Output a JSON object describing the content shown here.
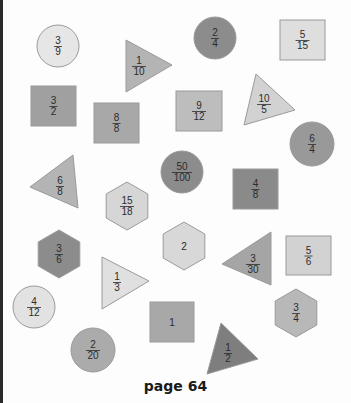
{
  "page": {
    "footer_label": "page 64",
    "colors": {
      "background": "#fdfdfd",
      "stroke": "#9a9a9a",
      "text": "#2b2b2b"
    }
  },
  "shapes": [
    {
      "id": "s1",
      "type": "circle",
      "label_num": "3",
      "label_den": "9",
      "cx": 58,
      "cy": 46,
      "r": 21,
      "fill": "#e6e6e6"
    },
    {
      "id": "s2",
      "type": "triangle",
      "label_num": "1",
      "label_den": "10",
      "points": [
        [
          126,
          40
        ],
        [
          172,
          65
        ],
        [
          126,
          92
        ]
      ],
      "tx": 139,
      "ty": 66,
      "fill": "#b4b4b4"
    },
    {
      "id": "s3",
      "type": "circle",
      "label_num": "2",
      "label_den": "4",
      "cx": 215,
      "cy": 38,
      "r": 21,
      "fill": "#8c8c8c"
    },
    {
      "id": "s4",
      "type": "square",
      "label_num": "5",
      "label_den": "15",
      "x": 280,
      "y": 20,
      "w": 45,
      "h": 40,
      "fill": "#dedede"
    },
    {
      "id": "s5",
      "type": "square",
      "label_num": "3",
      "label_den": "2",
      "x": 31,
      "y": 86,
      "w": 45,
      "h": 40,
      "fill": "#a0a0a0"
    },
    {
      "id": "s6",
      "type": "square",
      "label_num": "8",
      "label_den": "8",
      "x": 94,
      "y": 103,
      "w": 45,
      "h": 40,
      "fill": "#a8a8a8"
    },
    {
      "id": "s7",
      "type": "square",
      "label_num": "9",
      "label_den": "12",
      "x": 176,
      "y": 91,
      "w": 46,
      "h": 40,
      "fill": "#bdbdbd"
    },
    {
      "id": "s8",
      "type": "triangle",
      "label_num": "10",
      "label_den": "5",
      "points": [
        [
          256,
          74
        ],
        [
          295,
          110
        ],
        [
          244,
          125
        ]
      ],
      "tx": 264,
      "ty": 104,
      "fill": "#d2d2d2"
    },
    {
      "id": "s9",
      "type": "circle",
      "label_num": "6",
      "label_den": "4",
      "cx": 312,
      "cy": 144,
      "r": 22,
      "fill": "#999999"
    },
    {
      "id": "s10",
      "type": "triangle",
      "label_num": "6",
      "label_den": "8",
      "points": [
        [
          73,
          155
        ],
        [
          30,
          187
        ],
        [
          78,
          208
        ]
      ],
      "tx": 60,
      "ty": 186,
      "fill": "#b4b4b4"
    },
    {
      "id": "s11",
      "type": "circle",
      "label_num": "50",
      "label_den": "100",
      "cx": 182,
      "cy": 172,
      "r": 21,
      "fill": "#8c8c8c"
    },
    {
      "id": "s12",
      "type": "square",
      "label_num": "4",
      "label_den": "8",
      "x": 233,
      "y": 169,
      "w": 45,
      "h": 40,
      "fill": "#8a8a8a"
    },
    {
      "id": "s13",
      "type": "hexagon",
      "label_num": "15",
      "label_den": "18",
      "cx": 127,
      "cy": 206,
      "r": 24,
      "fill": "#d6d6d6"
    },
    {
      "id": "s14",
      "type": "hexagon",
      "label_num": "3",
      "label_den": "6",
      "cx": 59,
      "cy": 254,
      "r": 24,
      "fill": "#8c8c8c"
    },
    {
      "id": "s15",
      "type": "hexagon",
      "label": "2",
      "cx": 184,
      "cy": 246,
      "r": 24,
      "fill": "#d8d8d8"
    },
    {
      "id": "s16",
      "type": "triangle",
      "label_num": "3",
      "label_den": "30",
      "points": [
        [
          271,
          232
        ],
        [
          222,
          264
        ],
        [
          271,
          285
        ]
      ],
      "tx": 253,
      "ty": 264,
      "fill": "#a5a5a5"
    },
    {
      "id": "s17",
      "type": "square",
      "label_num": "5",
      "label_den": "6",
      "x": 286,
      "y": 236,
      "w": 45,
      "h": 39,
      "fill": "#d2d2d2"
    },
    {
      "id": "s18",
      "type": "triangle",
      "label_num": "1",
      "label_den": "3",
      "points": [
        [
          102,
          257
        ],
        [
          149,
          281
        ],
        [
          102,
          309
        ]
      ],
      "tx": 117,
      "ty": 282,
      "fill": "#e0e0e0"
    },
    {
      "id": "s19",
      "type": "circle",
      "label_num": "4",
      "label_den": "12",
      "cx": 34,
      "cy": 307,
      "r": 21,
      "fill": "#e2e2e2"
    },
    {
      "id": "s20",
      "type": "square",
      "label": "1",
      "x": 150,
      "y": 302,
      "w": 44,
      "h": 40,
      "fill": "#a8a8a8"
    },
    {
      "id": "s21",
      "type": "hexagon",
      "label_num": "3",
      "label_den": "4",
      "cx": 296,
      "cy": 313,
      "r": 24,
      "fill": "#b8b8b8"
    },
    {
      "id": "s22",
      "type": "circle",
      "label_num": "2",
      "label_den": "20",
      "cx": 93,
      "cy": 350,
      "r": 22,
      "fill": "#ababab"
    },
    {
      "id": "s23",
      "type": "triangle",
      "label_num": "1",
      "label_den": "2",
      "points": [
        [
          221,
          323
        ],
        [
          258,
          359
        ],
        [
          207,
          374
        ]
      ],
      "tx": 228,
      "ty": 353,
      "fill": "#7e7e7e"
    }
  ]
}
